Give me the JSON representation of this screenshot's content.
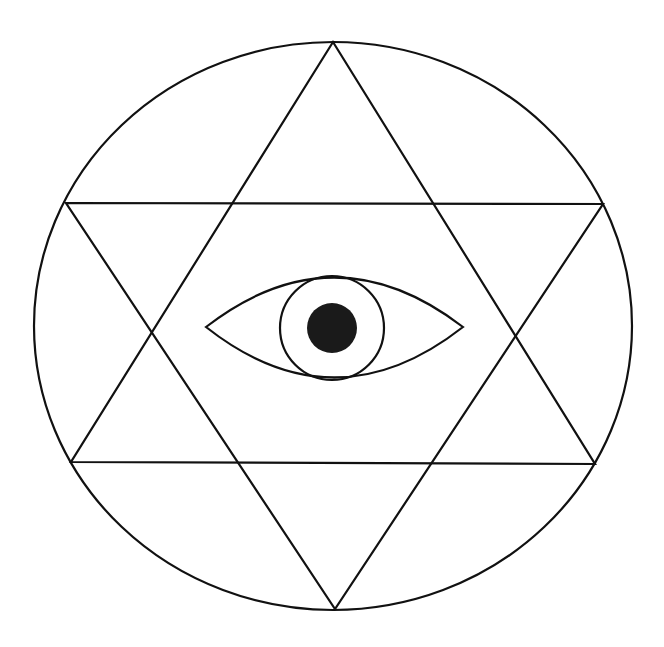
{
  "diagram": {
    "title": "Eye within hexagram within circle",
    "background_color": "#ffffff",
    "line_color": "#111111",
    "pupil_color": "#1a1a1a",
    "outer_circle": {
      "cx": 333,
      "cy": 326,
      "rx": 299,
      "ry": 284
    },
    "triangle_up": {
      "points": "333,42 71,462 595,464"
    },
    "triangle_down": {
      "points": "66,203 603,204 335,609"
    },
    "eye": {
      "outline_path": "M206,327 Q334,228 463,327 Q334,428 206,327 Z",
      "iris": {
        "cx": 332,
        "cy": 328,
        "r": 52
      },
      "pupil": {
        "cx": 332,
        "cy": 328,
        "r": 25
      }
    }
  }
}
